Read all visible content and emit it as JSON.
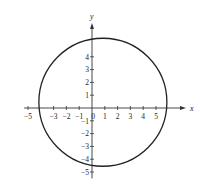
{
  "chart_data": {
    "type": "line",
    "title": "",
    "xlabel": "x",
    "ylabel": "y",
    "xlim": [
      -5.3,
      6.5
    ],
    "ylim": [
      -5.5,
      6.2
    ],
    "grid": false,
    "x_ticks": [
      -5,
      -3,
      -2,
      -1,
      0,
      1,
      2,
      3,
      4,
      5
    ],
    "x_tick_labels": [
      "−5",
      "−3",
      "−2",
      "−1",
      "0",
      "1",
      "2",
      "3",
      "4",
      "5"
    ],
    "y_ticks": [
      -5,
      -4,
      -3,
      -2,
      -1,
      1,
      2,
      3,
      4
    ],
    "y_tick_labels": [
      "−5",
      "−4",
      "−3",
      "−2",
      "−1",
      "1",
      "2",
      "3",
      "4"
    ],
    "series": [
      {
        "name": "circle",
        "shape": "circle",
        "center": [
          0.85,
          0.45
        ],
        "radius": 5.0
      }
    ],
    "colors": {
      "axis": "#333333",
      "curve": "#222222"
    }
  }
}
